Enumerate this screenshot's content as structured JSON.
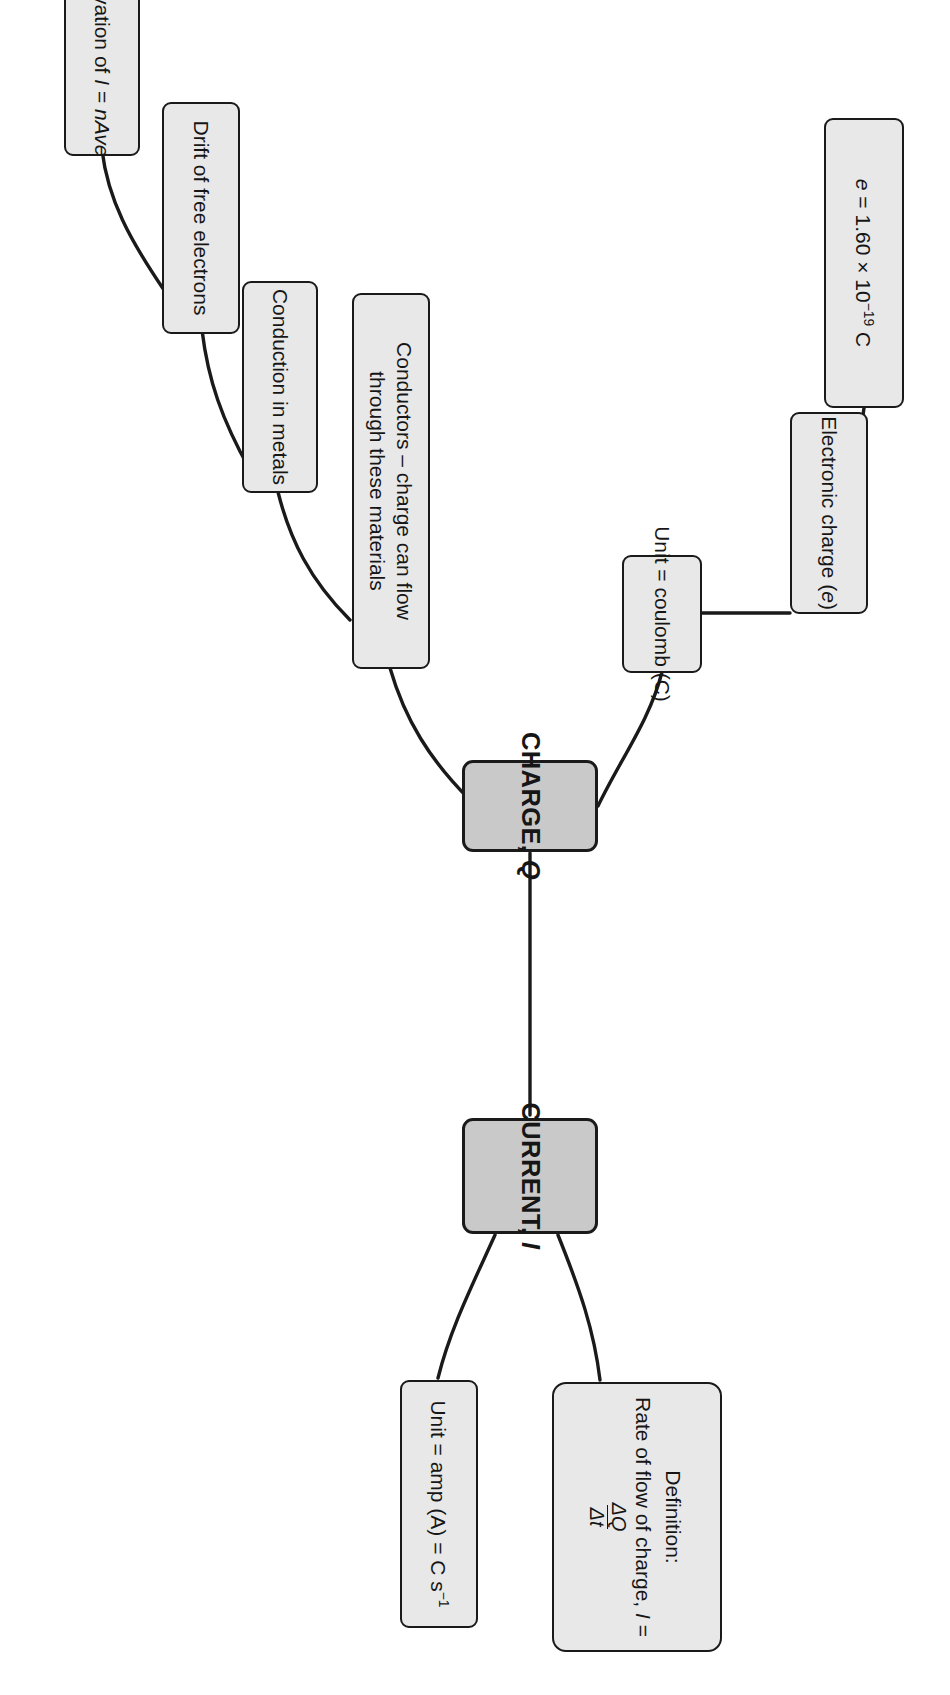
{
  "diagram": {
    "orientation": "rotated-90-clockwise",
    "colors": {
      "node_fill": "#e8e8e8",
      "main_node_fill": "#c9c9c9",
      "border": "#1a1a1a",
      "text": "#161616",
      "background": "#ffffff"
    },
    "nodes": {
      "charge": {
        "label_plain": "CHARGE, Q",
        "label_main": "CHARGE,",
        "label_italic": "Q"
      },
      "current": {
        "label_plain": "CURRENT, I",
        "label_main": "CURRENT,",
        "label_italic": "I"
      },
      "electronic_charge": {
        "label_plain": "Electronic charge (e)",
        "pre": "Electronic charge (",
        "italic": "e",
        "post": ")"
      },
      "electronic_charge_value": {
        "label_plain": "e = 1.60 × 10-19 C",
        "italic": "e",
        "rest": " = 1.60 × 10",
        "exponent": "−19",
        "unit": " C"
      },
      "unit_coulomb": {
        "label_plain": "Unit = coulomb (C)"
      },
      "unit_amp": {
        "label_plain": "Unit = amp (A) = C s-1",
        "pre": "Unit = amp (A) = C s",
        "exponent": "−1"
      },
      "conductors": {
        "label_plain": "Conductors – charge can flow through these materials"
      },
      "conduction_in_metals": {
        "label_plain": "Conduction in metals"
      },
      "drift_of_free_electrons": {
        "label_plain": "Drift of free electrons"
      },
      "derivation": {
        "label_plain": "Derivation of I = nAve",
        "pre": "Derivation of ",
        "italic1": "I",
        "mid": " = ",
        "italic2": "nAve"
      },
      "definition": {
        "line1": "Definition:",
        "line2_pre": "Rate of flow of charge, ",
        "line2_italic": "I",
        "line2_eq": " = ",
        "numerator": "ΔQ",
        "denominator": "Δt",
        "label_plain": "Definition: Rate of flow of charge, I = ΔQ/Δt"
      }
    }
  }
}
